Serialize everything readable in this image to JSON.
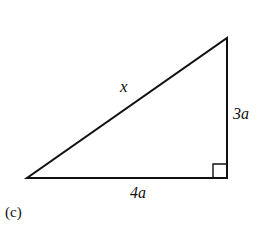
{
  "figure": {
    "panel_label": "(c)",
    "shape": "right-triangle",
    "hypotenuse_label": "x",
    "vertical_leg_label": "3a",
    "horizontal_leg_label": "4a",
    "right_angle_marker": "bottom-right",
    "stroke_color": "#111111",
    "background_color": "#ffffff"
  }
}
